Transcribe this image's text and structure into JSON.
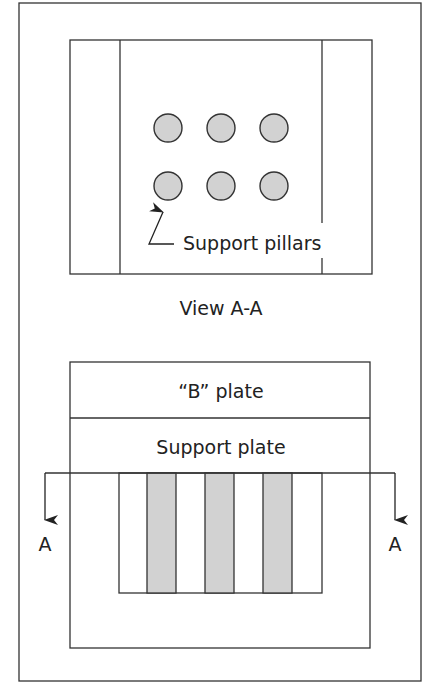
{
  "diagram": {
    "colors": {
      "stroke": "#333333",
      "pillar_fill": "#d2d2d2",
      "background": "#ffffff"
    },
    "top_view": {
      "caption": "View A-A",
      "pillar_callout": "Support pillars",
      "pillar_count": 6,
      "pillar_rows": 2,
      "pillar_cols": 3
    },
    "section_view": {
      "b_plate_label": "“B” plate",
      "support_plate_label": "Support plate",
      "section_marker_left": "A",
      "section_marker_right": "A",
      "pillar_count": 3
    }
  }
}
